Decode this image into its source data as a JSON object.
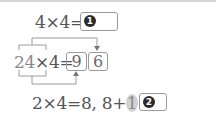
{
  "problem": {
    "row1": {
      "equation": "4×4=",
      "answer_marker": "1"
    },
    "diagram": {
      "tens": "2",
      "ones": "4",
      "times": "×4=",
      "box_tens_value": "9",
      "box_ones_value": "6"
    },
    "row3": {
      "part1": "2×4=8, 8+",
      "carry": "1",
      "equals": "=",
      "answer_marker": "2"
    }
  },
  "colors": {
    "line": "#9a9a9a",
    "arrow": "#777777",
    "highlight": "#d2d2d2"
  }
}
